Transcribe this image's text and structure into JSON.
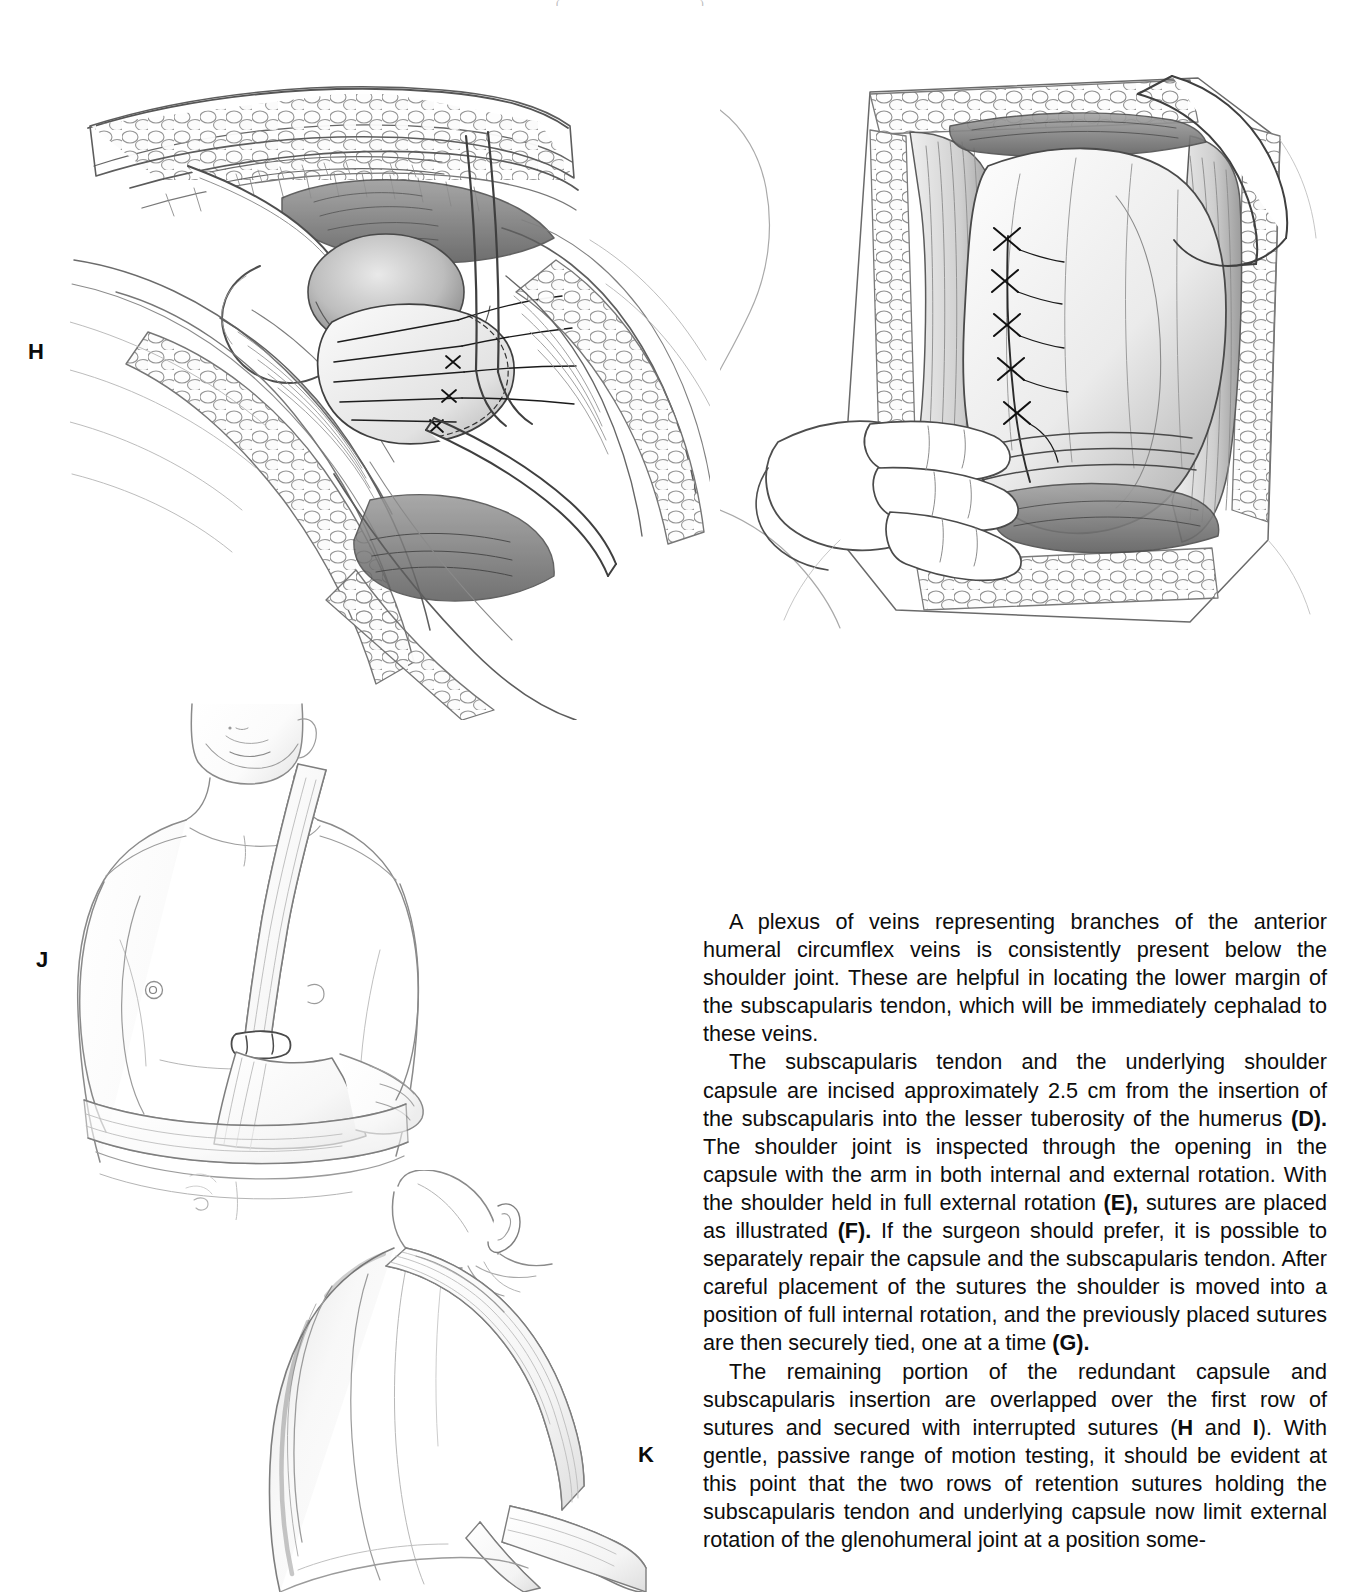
{
  "page": {
    "width": 1346,
    "height": 1592,
    "background_color": "#ffffff",
    "ink_color": "#0d0d0d"
  },
  "header_remnants": [
    {
      "text": "(",
      "left": 556
    },
    {
      "text": ")",
      "left": 700
    }
  ],
  "figures": [
    {
      "id": "H",
      "label": "H",
      "name": "figure-h-overlapping-capsule-repair",
      "caption_ref": "H",
      "description": "Surgical exposure of the anterior shoulder showing the redundant capsule and subscapularis insertion being overlapped over the first row of sutures, with retention sutures and retractors in place.",
      "style": "graphite pencil medical illustration"
    },
    {
      "id": "I",
      "label": "",
      "name": "figure-i-completed-interrupted-suture-row",
      "caption_ref": "I",
      "description": "Completed second row of interrupted sutures securing the overlapped capsule and subscapularis tendon, with a hand-held retractor displacing the deltoid.",
      "style": "graphite pencil medical illustration"
    },
    {
      "id": "J",
      "label": "J",
      "name": "figure-j-sling-and-swathe-anterior-view",
      "caption_ref": "J",
      "description": "Anterior view of the patient wearing a sling and swathe immobilizing the operated shoulder in internal rotation.",
      "style": "graphite pencil medical illustration"
    },
    {
      "id": "K",
      "label": "K",
      "name": "figure-k-sling-and-swathe-posterior-view",
      "caption_ref": "K",
      "description": "Posterior view of the same patient showing the sling strap crossing the back and the swathe encircling the trunk.",
      "style": "graphite pencil medical illustration"
    }
  ],
  "body_text": {
    "paragraphs": [
      {
        "id": "para-veins",
        "runs": [
          {
            "text": "A plexus of veins representing branches of the anterior humeral circumflex veins is consistently present below the shoulder joint. These are helpful in locating the lower margin of the subscapularis tendon, which will be immediately cephalad to these veins.",
            "bold": false
          }
        ]
      },
      {
        "id": "para-subscapularis",
        "runs": [
          {
            "text": "The subscapularis tendon and the underlying shoulder capsule are incised approximately 2.5 cm from the insertion of the subscapularis into the lesser tuberosity of the humerus ",
            "bold": false
          },
          {
            "text": "(D).",
            "bold": true
          },
          {
            "text": " The shoulder joint is inspected through the opening in the capsule with the arm in both internal and external rotation. With the shoulder held in full external rotation ",
            "bold": false
          },
          {
            "text": "(E),",
            "bold": true
          },
          {
            "text": " sutures are placed as illustrated ",
            "bold": false
          },
          {
            "text": "(F).",
            "bold": true
          },
          {
            "text": " If the surgeon should prefer, it is possible to separately repair the capsule and the subscapularis tendon. After careful placement of the sutures the shoulder is moved into a position of full internal rotation, and the previously placed sutures are then securely tied, one at a time ",
            "bold": false
          },
          {
            "text": "(G).",
            "bold": true
          }
        ]
      },
      {
        "id": "para-remaining",
        "runs": [
          {
            "text": "The remaining portion of the redundant capsule and subscapularis insertion are overlapped over the first row of sutures and secured with interrupted sutures (",
            "bold": false
          },
          {
            "text": "H",
            "bold": true
          },
          {
            "text": " and ",
            "bold": false
          },
          {
            "text": "I",
            "bold": true
          },
          {
            "text": "). With gentle, passive range of motion testing, it should be evident at this point that the two rows of retention sutures holding the subscapularis tendon and underlying capsule now limit external rotation of the glenohumeral joint at a position some-",
            "bold": false
          }
        ]
      }
    ]
  }
}
